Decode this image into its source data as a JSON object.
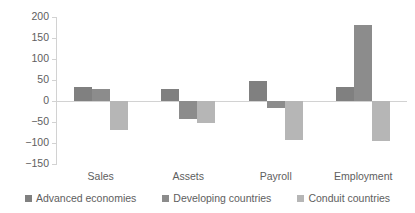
{
  "chart_data": {
    "type": "bar",
    "title": "",
    "subtitle": "",
    "xlabel": "",
    "ylabel": "",
    "categories": [
      "Sales",
      "Assets",
      "Payroll",
      "Employment"
    ],
    "series": [
      {
        "name": "Advanced economies",
        "color": "#808080",
        "values": [
          33,
          28,
          48,
          33
        ]
      },
      {
        "name": "Developing countries",
        "color": "#8c8c8c",
        "values": [
          28,
          -42,
          -17,
          180
        ]
      },
      {
        "name": "Conduit countries",
        "color": "#b6b6b6",
        "values": [
          -68,
          -53,
          -92,
          -95
        ]
      }
    ],
    "ylim": [
      -150,
      200
    ],
    "yticks": [
      200,
      150,
      100,
      50,
      0,
      -50,
      -100,
      -150
    ],
    "ytick_labels": [
      "200",
      "150",
      "100",
      "50",
      "0",
      "−50",
      "−100",
      "−150"
    ],
    "grid": false,
    "legend_position": "bottom",
    "axis_color": "#d2d2d2",
    "text_color": "#5e5e5e",
    "background": "#ffffff"
  }
}
